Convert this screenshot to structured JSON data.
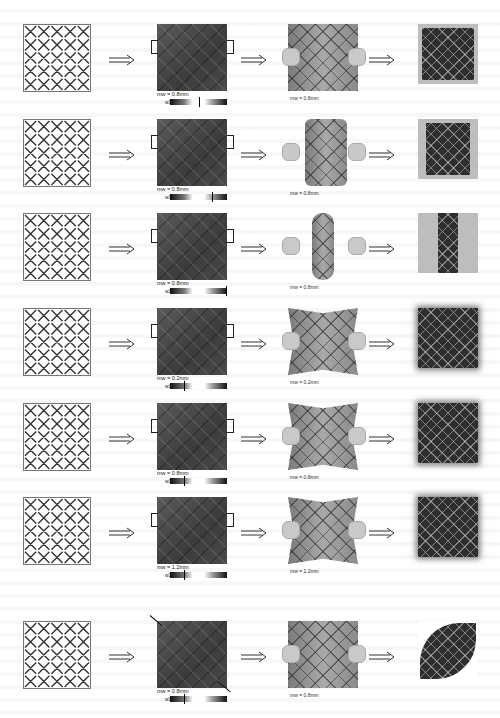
{
  "figure": {
    "arrow_glyph": "⟹",
    "colorbar_label": "w1 =",
    "columns": [
      "lattice-pattern",
      "simulated-pattern-with-boundary",
      "physical-deformation-photo",
      "final-shape-result"
    ],
    "rows": [
      {
        "id": 1,
        "sim_mw_label": "mw = 0.8mm",
        "photo_mw_label": "mw = 0.8mm",
        "marker_pos_pct": 50,
        "deformation": "flat-stretch"
      },
      {
        "id": 2,
        "sim_mw_label": "mw = 0.8mm",
        "photo_mw_label": "mw = 0.8mm",
        "marker_pos_pct": 74,
        "deformation": "cylindrical-bend"
      },
      {
        "id": 3,
        "sim_mw_label": "mw = 0.8mm",
        "photo_mw_label": "mw = 0.8mm",
        "marker_pos_pct": 98,
        "deformation": "tight-roll"
      },
      {
        "id": 4,
        "sim_mw_label": "mw = 0.2mm",
        "photo_mw_label": "mw = 0.2mm",
        "marker_pos_pct": 25,
        "deformation": "saddle"
      },
      {
        "id": 5,
        "sim_mw_label": "mw = 0.8mm",
        "photo_mw_label": "mw = 0.8mm",
        "marker_pos_pct": 25,
        "deformation": "saddle"
      },
      {
        "id": 6,
        "sim_mw_label": "mw = 1.2mm",
        "photo_mw_label": "mw = 1.2mm",
        "marker_pos_pct": 25,
        "deformation": "saddle"
      },
      {
        "id": 7,
        "sim_mw_label": "mw = 0.8mm",
        "photo_mw_label": "mw = 0.8mm",
        "marker_pos_pct": 25,
        "deformation": "diagonal-twist-leaf"
      }
    ]
  }
}
